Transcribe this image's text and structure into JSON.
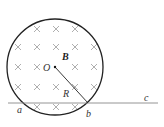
{
  "diagram": {
    "type": "magnetic-field-region",
    "circle": {
      "cx": 55,
      "cy": 67,
      "r": 48,
      "stroke": "#222222"
    },
    "center_label": "O",
    "field_label": "B",
    "radius_label": "R",
    "field_direction": "into page (×)",
    "line": {
      "from": "a",
      "through": "b",
      "to": "c",
      "color": "#888888"
    },
    "points": [
      {
        "label": "a",
        "x": 19,
        "y": 111
      },
      {
        "label": "b",
        "x": 88,
        "y": 114
      },
      {
        "label": "c",
        "x": 146,
        "y": 100
      }
    ],
    "crosses": [
      [
        37,
        29
      ],
      [
        56,
        29
      ],
      [
        75,
        29
      ],
      [
        18,
        47
      ],
      [
        37,
        47
      ],
      [
        56,
        47
      ],
      [
        75,
        47
      ],
      [
        94,
        47
      ],
      [
        18,
        67
      ],
      [
        37,
        67
      ],
      [
        75,
        67
      ],
      [
        94,
        67
      ],
      [
        18,
        87
      ],
      [
        37,
        87
      ],
      [
        56,
        87
      ],
      [
        75,
        87
      ],
      [
        94,
        87
      ],
      [
        37,
        107
      ],
      [
        56,
        107
      ],
      [
        75,
        107
      ]
    ]
  }
}
